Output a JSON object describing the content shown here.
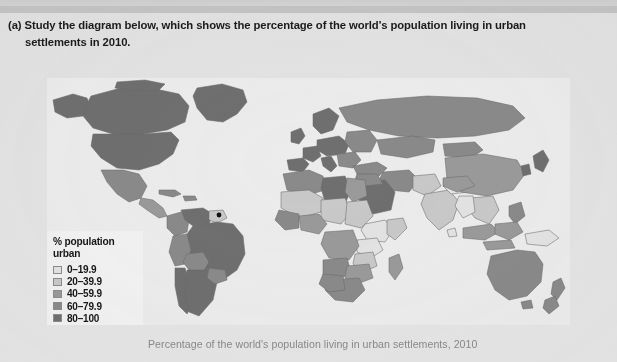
{
  "prompt": {
    "line1": "(a) Study the diagram below, which shows the percentage of the world's population living in urban",
    "line2": "settlements in 2010."
  },
  "legend": {
    "title_line1": "% population",
    "title_line2": "urban",
    "items": [
      {
        "label": "0–19.9",
        "color": "#e3e3e3"
      },
      {
        "label": "20–39.9",
        "color": "#c9c9c9"
      },
      {
        "label": "40–59.9",
        "color": "#9a9a9a"
      },
      {
        "label": "60–79.9",
        "color": "#8a8a8a"
      },
      {
        "label": "80–100",
        "color": "#6f6f6f"
      }
    ]
  },
  "caption": "Percentage of the world's population living in urban settlements, 2010",
  "map": {
    "ocean_color": "#ececec",
    "border_color": "#6a6a6a",
    "marker_color": "#111111"
  },
  "chart_data": {
    "type": "choropleth-map",
    "title": "Percentage of the world's population living in urban settlements, 2010",
    "value_unit": "% of population living in urban settlements",
    "legend_position": "bottom-left",
    "classes": [
      {
        "range": "0–19.9",
        "min": 0,
        "max": 19.9,
        "color": "#e3e3e3"
      },
      {
        "range": "20–39.9",
        "min": 20,
        "max": 39.9,
        "color": "#c9c9c9"
      },
      {
        "range": "40–59.9",
        "min": 40,
        "max": 59.9,
        "color": "#9a9a9a"
      },
      {
        "range": "60–79.9",
        "min": 60,
        "max": 79.9,
        "color": "#8a8a8a"
      },
      {
        "range": "80–100",
        "min": 80,
        "max": 100,
        "color": "#6f6f6f"
      }
    ],
    "regions": [
      {
        "name": "Canada",
        "class": "80–100"
      },
      {
        "name": "United States",
        "class": "80–100"
      },
      {
        "name": "Greenland",
        "class": "80–100"
      },
      {
        "name": "Mexico",
        "class": "60–79.9"
      },
      {
        "name": "Central America",
        "class": "40–59.9"
      },
      {
        "name": "Caribbean",
        "class": "60–79.9"
      },
      {
        "name": "Brazil",
        "class": "80–100"
      },
      {
        "name": "Argentina",
        "class": "80–100"
      },
      {
        "name": "Chile",
        "class": "80–100"
      },
      {
        "name": "Venezuela",
        "class": "80–100"
      },
      {
        "name": "Colombia",
        "class": "60–79.9"
      },
      {
        "name": "Peru",
        "class": "60–79.9"
      },
      {
        "name": "Bolivia",
        "class": "60–79.9"
      },
      {
        "name": "Paraguay",
        "class": "60–79.9"
      },
      {
        "name": "Guyana",
        "class": "20–39.9"
      },
      {
        "name": "Western Europe",
        "class": "80–100"
      },
      {
        "name": "Northern Europe",
        "class": "80–100"
      },
      {
        "name": "Eastern Europe",
        "class": "60–79.9"
      },
      {
        "name": "Russia",
        "class": "60–79.9"
      },
      {
        "name": "Kazakhstan",
        "class": "60–79.9"
      },
      {
        "name": "North Africa",
        "class": "60–79.9"
      },
      {
        "name": "Libya",
        "class": "80–100"
      },
      {
        "name": "Egypt",
        "class": "40–59.9"
      },
      {
        "name": "Sahel",
        "class": "20–39.9"
      },
      {
        "name": "Nigeria",
        "class": "40–59.9"
      },
      {
        "name": "Ethiopia",
        "class": "0–19.9"
      },
      {
        "name": "Kenya",
        "class": "20–39.9"
      },
      {
        "name": "Uganda",
        "class": "0–19.9"
      },
      {
        "name": "Tanzania",
        "class": "20–39.9"
      },
      {
        "name": "DR Congo",
        "class": "40–59.9"
      },
      {
        "name": "Angola",
        "class": "60–79.9"
      },
      {
        "name": "Zambia",
        "class": "40–59.9"
      },
      {
        "name": "Zimbabwe",
        "class": "40–59.9"
      },
      {
        "name": "South Africa",
        "class": "60–79.9"
      },
      {
        "name": "Botswana",
        "class": "60–79.9"
      },
      {
        "name": "Madagascar",
        "class": "40–59.9"
      },
      {
        "name": "Saudi Arabia",
        "class": "80–100"
      },
      {
        "name": "Middle East",
        "class": "60–79.9"
      },
      {
        "name": "Turkey",
        "class": "60–79.9"
      },
      {
        "name": "Iran",
        "class": "60–79.9"
      },
      {
        "name": "India",
        "class": "20–39.9"
      },
      {
        "name": "Pakistan",
        "class": "20–39.9"
      },
      {
        "name": "Bangladesh",
        "class": "20–39.9"
      },
      {
        "name": "Nepal",
        "class": "0–19.9"
      },
      {
        "name": "Sri Lanka",
        "class": "0–19.9"
      },
      {
        "name": "China",
        "class": "40–59.9"
      },
      {
        "name": "Mongolia",
        "class": "60–79.9"
      },
      {
        "name": "Japan",
        "class": "80–100"
      },
      {
        "name": "South Korea",
        "class": "80–100"
      },
      {
        "name": "Thailand",
        "class": "20–39.9"
      },
      {
        "name": "Vietnam",
        "class": "20–39.9"
      },
      {
        "name": "Cambodia",
        "class": "0–19.9"
      },
      {
        "name": "Indonesia",
        "class": "40–59.9"
      },
      {
        "name": "Philippines",
        "class": "60–79.9"
      },
      {
        "name": "Malaysia",
        "class": "60–79.9"
      },
      {
        "name": "Papua New Guinea",
        "class": "0–19.9"
      },
      {
        "name": "Australia",
        "class": "80–100"
      },
      {
        "name": "New Zealand",
        "class": "80–100"
      }
    ]
  }
}
